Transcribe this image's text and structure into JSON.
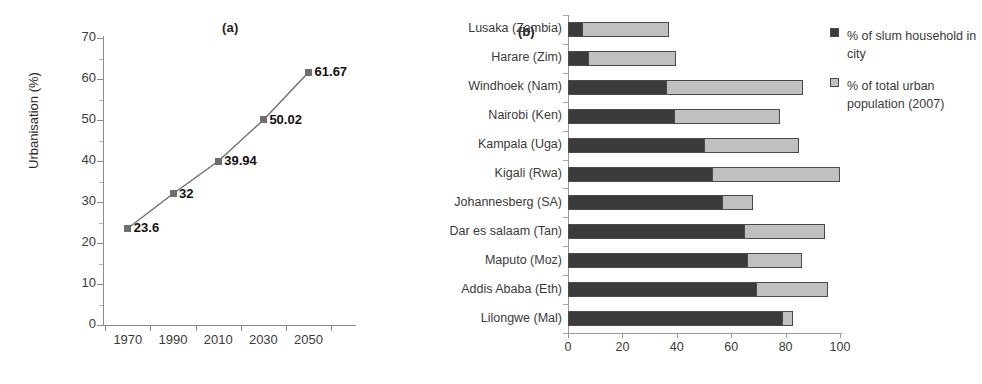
{
  "chart_data": [
    {
      "type": "line",
      "panel": "(a)",
      "title": "",
      "xlabel": "",
      "ylabel": "Urbanisation (%)",
      "categories": [
        "1970",
        "1990",
        "2010",
        "2030",
        "2050"
      ],
      "values": [
        23.6,
        32,
        39.94,
        50.02,
        61.67
      ],
      "data_labels": [
        "23.6",
        "32",
        "39.94",
        "50.02",
        "61.67"
      ],
      "yticks": [
        "0",
        "10",
        "20",
        "30",
        "40",
        "50",
        "60",
        "70"
      ],
      "ylim": [
        0,
        70
      ],
      "grid": false,
      "legend": "none",
      "marker": "square",
      "series_color": "#6e6e6e"
    },
    {
      "type": "bar",
      "orientation": "horizontal",
      "stacked": false,
      "overlapped": true,
      "panel": "(b)",
      "title": "",
      "xlabel": "",
      "ylabel": "",
      "categories": [
        "Lusaka (Zambia)",
        "Harare (Zim)",
        "Windhoek (Nam)",
        "Nairobi (Ken)",
        "Kampala (Uga)",
        "Kigali (Rwa)",
        "Johannesberg (SA)",
        "Dar es salaam (Tan)",
        "Maputo (Moz)",
        "Addis Ababa (Eth)",
        "Lilongwe (Mal)"
      ],
      "series": [
        {
          "name": "% of slum household in city",
          "color": "#3b3b3b",
          "values": [
            5.5,
            7.7,
            36.3,
            39.3,
            50.4,
            53.3,
            56.9,
            65.0,
            66.3,
            69.4,
            78.9
          ]
        },
        {
          "name": "% of total urban population (2007)",
          "color": "#c0c0c0",
          "values": [
            37.0,
            39.7,
            86.4,
            78.0,
            85.0,
            100.0,
            68.0,
            94.5,
            86.0,
            95.7,
            82.8
          ]
        }
      ],
      "xticks": [
        "0",
        "20",
        "40",
        "60",
        "80",
        "100"
      ],
      "xlim": [
        0,
        100
      ],
      "grid": false,
      "legend_position": "right",
      "legend": [
        "% of slum household in city",
        "% of total urban population (2007)"
      ]
    }
  ],
  "panel_a": {
    "tag": "(a)",
    "ylabel": "Urbanisation (%)",
    "yticks": [
      "70",
      "60",
      "50",
      "40",
      "30",
      "20",
      "10",
      "0"
    ],
    "xticks": [
      "1970",
      "1990",
      "2010",
      "2030",
      "2050"
    ],
    "point_labels": [
      "23.6",
      "32",
      "39.94",
      "50.02",
      "61.67"
    ]
  },
  "panel_b": {
    "tag": "(b)",
    "categories": [
      "Lusaka (Zambia)",
      "Harare (Zim)",
      "Windhoek (Nam)",
      "Nairobi (Ken)",
      "Kampala (Uga)",
      "Kigali (Rwa)",
      "Johannesberg (SA)",
      "Dar es salaam (Tan)",
      "Maputo (Moz)",
      "Addis Ababa (Eth)",
      "Lilongwe (Mal)"
    ],
    "xticks": [
      "0",
      "20",
      "40",
      "60",
      "80",
      "100"
    ],
    "legend": [
      {
        "label": "% of slum household in city",
        "color": "#3b3b3b"
      },
      {
        "label": "% of total urban population (2007)",
        "color": "#c0c0c0"
      }
    ]
  }
}
